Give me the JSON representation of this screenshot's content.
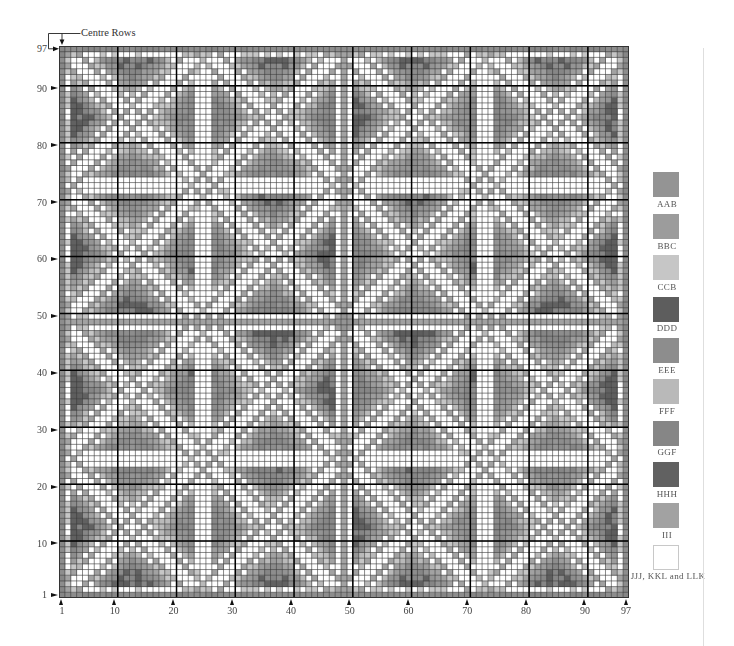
{
  "annotation": {
    "centre_rows_label": "Centre Rows"
  },
  "chart": {
    "cols": 97,
    "rows": 97,
    "centre_col": 49,
    "centre_row": 49,
    "row_labels": [
      "97",
      "90",
      "80",
      "70",
      "60",
      "50",
      "40",
      "30",
      "20",
      "10",
      "1"
    ],
    "col_labels": [
      "1",
      "10",
      "20",
      "30",
      "40",
      "50",
      "60",
      "70",
      "80",
      "90",
      "97"
    ],
    "major_cols_after": [
      10,
      20,
      30,
      40,
      50,
      60,
      70,
      80,
      90
    ],
    "major_rows_above": [
      90,
      80,
      70,
      60,
      50,
      40,
      30,
      20,
      10
    ],
    "grid_line_color": "#3a3a3a",
    "major_line_color": "#000000"
  },
  "legend": {
    "items": [
      {
        "code": "AAB",
        "color": "#949494"
      },
      {
        "code": "BBC",
        "color": "#9c9c9c"
      },
      {
        "code": "CCB",
        "color": "#c6c6c6"
      },
      {
        "code": "DDD",
        "color": "#5d5d5d"
      },
      {
        "code": "EEE",
        "color": "#8d8d8d"
      },
      {
        "code": "FFF",
        "color": "#b9b9b9"
      },
      {
        "code": "GGF",
        "color": "#868686"
      },
      {
        "code": "HHH",
        "color": "#616161"
      },
      {
        "code": "III",
        "color": "#a2a2a2"
      },
      {
        "code": "JJJ, KKL and LLK",
        "color": "#ffffff"
      }
    ]
  },
  "pattern": {
    "lattice_period": 24,
    "diff_line_mod": 0,
    "sum_line_mod": 2,
    "ribbon_edge_offset": 2,
    "ribbon_code": "III",
    "ribbon_alt_code": "FFF",
    "border_code": "EEE",
    "border_alt_code": "GGF",
    "inner_ring_code": "CCB",
    "inner_ring_density": 0.45,
    "centre_line_code": "III",
    "centre_knot_code": "AAB",
    "centre_knot_radius": 2,
    "bowtie_radius": 8,
    "bowtie_gap": 1,
    "vertical_bowtie_col_mod": 13,
    "tone_edge": 0.9,
    "tone_centre": 0.84,
    "tone_inner": 0.76,
    "tone_variation": 0.16,
    "cell_noise": 0.16,
    "soft_edge_code": "CCB",
    "soft_edge_density": 0.3,
    "tone_levels": [
      {
        "max": 0.16,
        "code": null
      },
      {
        "max": 0.3,
        "code": "CCB"
      },
      {
        "max": 0.42,
        "code": "FFF"
      },
      {
        "max": 0.52,
        "code": "III"
      },
      {
        "max": 0.6,
        "code": "BBC"
      },
      {
        "max": 0.68,
        "code": "AAB"
      },
      {
        "max": 0.76,
        "code": "EEE"
      },
      {
        "max": 0.84,
        "code": "GGF"
      },
      {
        "max": 0.92,
        "code": "HHH"
      },
      {
        "max": 9,
        "code": "DDD"
      }
    ]
  }
}
